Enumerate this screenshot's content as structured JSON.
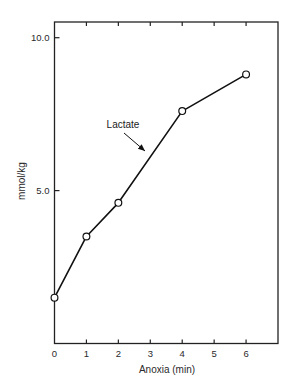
{
  "chart_data": {
    "type": "line",
    "title": "",
    "xlabel": "Anoxia (min)",
    "ylabel": "mmol/kg",
    "xlim": [
      0,
      7
    ],
    "ylim": [
      0,
      10.6
    ],
    "x_ticks": [
      0,
      1,
      2,
      3,
      4,
      5,
      6
    ],
    "x_tick_labels": [
      "0",
      "1",
      "2",
      "3",
      "4",
      "5",
      "6"
    ],
    "y_ticks": [
      5.0,
      10.0
    ],
    "y_tick_labels": [
      "5.0",
      "10.0"
    ],
    "grid": false,
    "frame": "box",
    "legend": null,
    "series": [
      {
        "name": "Lactate",
        "marker": "open-circle",
        "color": "#111111",
        "x": [
          0,
          1,
          2,
          4,
          6
        ],
        "values": [
          1.5,
          3.5,
          4.6,
          7.6,
          8.8
        ]
      }
    ],
    "annotations": [
      {
        "text": "Lactate",
        "arrow_to_series": "Lactate",
        "arrow_target_x": 2.9
      }
    ]
  },
  "colors": {
    "line": "#111111",
    "axis": "#222222",
    "text": "#2a2a2a",
    "background": "#ffffff"
  }
}
